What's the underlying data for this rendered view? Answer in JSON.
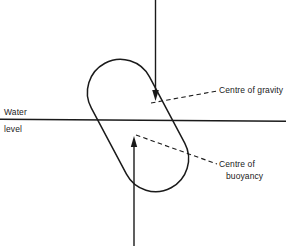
{
  "figure": {
    "background_color": "#ffffff",
    "ink_color": "#1a1a1a"
  },
  "labels": {
    "water": "Water",
    "level": "level",
    "centre_of_gravity": "Centre of gravity",
    "centre_of_buoyancy_line1": "Centre of",
    "centre_of_buoyancy_line2": "buoyancy"
  },
  "geometry": {
    "water_line": {
      "x1": 0,
      "y1": 119,
      "x2": 286,
      "y2": 121
    },
    "body_capsule": {
      "cap_top_center": [
        172,
        62
      ],
      "cap_bottom_center": [
        104,
        189
      ],
      "radius": 33,
      "tilt_degrees": -28
    },
    "gravity_arrow": {
      "from": [
        155,
        0
      ],
      "to": [
        155,
        100
      ],
      "direction": "down",
      "point_marked": [
        152,
        101
      ]
    },
    "buoyancy_arrow": {
      "from": [
        134,
        246
      ],
      "to": [
        134,
        136
      ],
      "direction": "up",
      "point_marked": [
        134,
        136
      ]
    },
    "leader_cog": {
      "from": [
        152,
        102
      ],
      "to": [
        216,
        91
      ],
      "style": "dashed"
    },
    "leader_cob": {
      "from": [
        135,
        136
      ],
      "to": [
        216,
        164
      ],
      "style": "dashed"
    }
  }
}
